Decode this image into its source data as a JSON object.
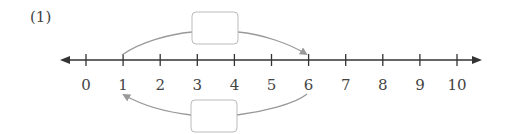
{
  "problem": {
    "label": "(1)"
  },
  "number_line": {
    "min": 0,
    "max": 10,
    "ticks": [
      "0",
      "1",
      "2",
      "3",
      "4",
      "5",
      "6",
      "7",
      "8",
      "9",
      "10"
    ],
    "line_color": "#333333",
    "arc_color": "#999999"
  },
  "jumps": {
    "forward": {
      "from": 1,
      "to": 6,
      "box_value": ""
    },
    "backward": {
      "from": 6,
      "to": 1,
      "box_value": ""
    }
  }
}
